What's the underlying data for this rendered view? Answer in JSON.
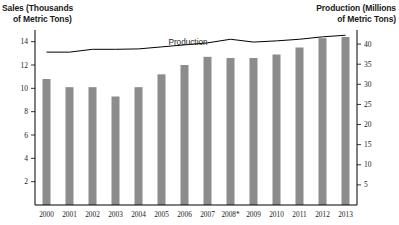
{
  "chart_data": {
    "type": "bar",
    "title": "",
    "categories": [
      "2000",
      "2001",
      "2002",
      "2003",
      "2004",
      "2005",
      "2006",
      "2007",
      "2008*",
      "2009",
      "2010",
      "2011",
      "2012",
      "2013"
    ],
    "xlabel": "",
    "ylabel": "Sales (Thousands of Metric Tons)",
    "y2label": "Production (Millions of Metric Tons)",
    "ylim": [
      0,
      15
    ],
    "y2lim": [
      0,
      43.5
    ],
    "yticks": [
      2,
      4,
      6,
      8,
      10,
      12,
      14
    ],
    "y2ticks": [
      5,
      10,
      15,
      20,
      25,
      30,
      35,
      40
    ],
    "grid": false,
    "legend_position": "inline-annotation",
    "series": [
      {
        "name": "Sales",
        "type": "bar",
        "axis": "left",
        "color": "#8c8c8c",
        "values": [
          10.8,
          10.1,
          10.1,
          9.3,
          10.1,
          11.2,
          12.0,
          12.7,
          12.6,
          12.6,
          12.9,
          13.5,
          14.3,
          14.4
        ]
      },
      {
        "name": "Production",
        "type": "line",
        "axis": "right",
        "color": "#000000",
        "values": [
          38.0,
          38.0,
          38.7,
          38.7,
          38.8,
          39.3,
          39.8,
          40.3,
          41.2,
          40.5,
          40.8,
          41.2,
          41.8,
          42.2
        ]
      }
    ],
    "annotations": [
      {
        "text": "Production",
        "x_category": "2005",
        "note": "label above production line"
      }
    ]
  },
  "left_axis_title": {
    "line1": "Sales (Thousands",
    "line2": "of Metric Tons)"
  },
  "right_axis_title": {
    "line1": "Production (Millions",
    "line2": "of Metric Tons)"
  },
  "series_label": "Production"
}
